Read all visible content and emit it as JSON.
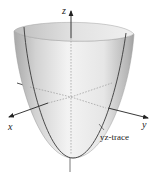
{
  "figure": {
    "type": "3D surface diagram",
    "surface": "elliptic paraboloid",
    "axes": {
      "x_label": "x",
      "y_label": "y",
      "z_label": "z"
    },
    "annotations": {
      "trace_label": "yz-trace"
    },
    "colors": {
      "surface_light": "#f2f2f2",
      "surface_dark": "#a8a8a8",
      "rim_inner": "#d9d9d9",
      "axis": "#222222",
      "trace": "#3a3a3a",
      "hidden_line": "#9a9a9a"
    }
  }
}
